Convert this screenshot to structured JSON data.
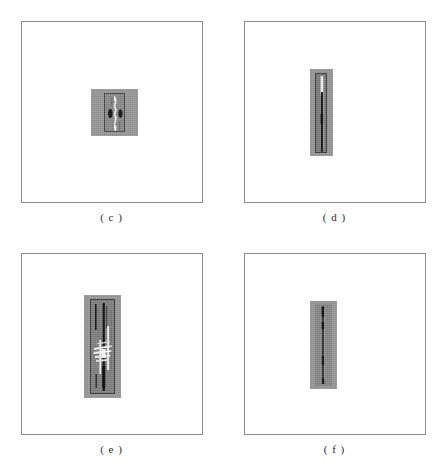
{
  "figure": {
    "title": "",
    "layout": {
      "columns": 2,
      "rows": 2,
      "width_px": 446,
      "height_px": 465
    },
    "background_color": "#ffffff",
    "frame_border_color": "#8e8e8e",
    "patch_fill_color": "#9a9a9a",
    "streak_dark_color": "#1b1b1b",
    "streak_light_color": "#f2f2f2",
    "panels": [
      {
        "id": "c",
        "label": "( c )",
        "patch": {
          "fill": "#9a9a9a",
          "shape": "square",
          "width": 47,
          "height": 47
        },
        "inner_box": {
          "stroke": "#4a4a4a",
          "fill": "#8d8d8d",
          "width": 21,
          "height": 39
        },
        "content_description": "compact bright blob with symmetric dark lobes"
      },
      {
        "id": "d",
        "label": "( d )",
        "patch": {
          "fill": "#9a9a9a",
          "shape": "tall-rectangle",
          "width": 23,
          "height": 87
        },
        "inner_box": {
          "stroke": "#3f3f3f",
          "fill": "#7e7e7e",
          "width": 12,
          "height": 80
        },
        "content_description": "single long thin vertical dark line with bright top segment"
      },
      {
        "id": "e",
        "label": "( e )",
        "patch": {
          "fill": "#9a9a9a",
          "shape": "tall-rectangle",
          "width": 37,
          "height": 103
        },
        "inner_box": {
          "stroke": "#3a3a3a",
          "fill": "#838383",
          "width": 25,
          "height": 95
        },
        "content_description": "multiple vertical dark and bright streaks with bright flare at mid height"
      },
      {
        "id": "f",
        "label": "( f )",
        "patch": {
          "fill": "#9a9a9a",
          "shape": "tall-rectangle",
          "width": 27,
          "height": 88
        },
        "inner_box": {
          "stroke": "#4a4a4a",
          "fill": "#8a8a8a",
          "width": 17,
          "height": 82
        },
        "content_description": "single narrow vertical dark line, faint, slightly beaded"
      }
    ]
  }
}
